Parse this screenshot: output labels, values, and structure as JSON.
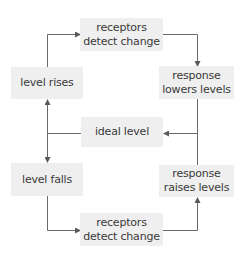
{
  "diagram": {
    "type": "feedback-loop",
    "colors": {
      "box_fill": "#efefef",
      "text": "#3a3a3a",
      "line": "#5a5a5a"
    },
    "nodes": {
      "receptors_top": {
        "line1": "receptors",
        "line2": "detect change"
      },
      "level_rises": {
        "label": "level rises"
      },
      "response_lowers": {
        "line1": "response",
        "line2": "lowers levels"
      },
      "ideal_level": {
        "label": "ideal level"
      },
      "level_falls": {
        "label": "level falls"
      },
      "response_raises": {
        "line1": "response",
        "line2": "raises levels"
      },
      "receptors_bottom": {
        "line1": "receptors",
        "line2": "detect change"
      }
    },
    "edges": [
      {
        "from": "level rises",
        "to": "receptors detect change (top)"
      },
      {
        "from": "receptors detect change (top)",
        "to": "response lowers levels"
      },
      {
        "from": "response lowers levels",
        "to": "ideal level"
      },
      {
        "from": "ideal level",
        "to": "level rises"
      },
      {
        "from": "ideal level",
        "to": "level falls"
      },
      {
        "from": "level falls",
        "to": "receptors detect change (bottom)"
      },
      {
        "from": "receptors detect change (bottom)",
        "to": "response raises levels"
      },
      {
        "from": "response raises levels",
        "to": "ideal level"
      }
    ]
  }
}
